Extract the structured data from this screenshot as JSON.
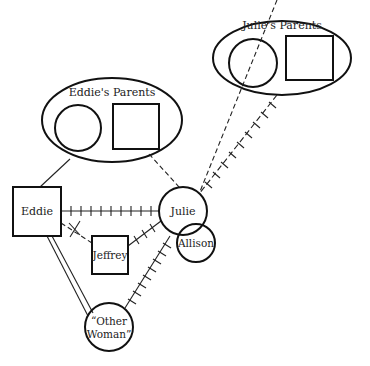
{
  "diagram": {
    "type": "genogram",
    "nodes": [
      {
        "id": "eddies-parents",
        "label": "Eddie's Parents",
        "shape": "ellipse-group",
        "members": [
          "female",
          "male"
        ]
      },
      {
        "id": "julies-parents",
        "label": "Julie's Parents",
        "shape": "ellipse-group",
        "members": [
          "female",
          "male"
        ]
      },
      {
        "id": "eddie",
        "label": "Eddie",
        "shape": "square"
      },
      {
        "id": "julie",
        "label": "Julie",
        "shape": "circle"
      },
      {
        "id": "allison",
        "label": "Allison",
        "shape": "circle"
      },
      {
        "id": "jeffrey",
        "label": "Jeffrey",
        "shape": "square"
      },
      {
        "id": "other-woman",
        "label_line1": "“Other",
        "label_line2": "Woman”",
        "shape": "circle"
      }
    ],
    "edges": [
      {
        "from": "eddies-parents",
        "to": "eddie",
        "style": "solid"
      },
      {
        "from": "eddies-parents",
        "to": "julie",
        "style": "dashed"
      },
      {
        "from": "julies-parents",
        "to": "julie",
        "style": "conflict-hatched"
      },
      {
        "from": "eddie",
        "to": "julie",
        "style": "conflict-hatched"
      },
      {
        "from": "eddie",
        "to": "jeffrey",
        "style": "dashed-cut"
      },
      {
        "from": "julie",
        "to": "jeffrey",
        "style": "conflict-hatched"
      },
      {
        "from": "julie",
        "to": "other-woman",
        "style": "conflict-hatched"
      },
      {
        "from": "eddie",
        "to": "other-woman",
        "style": "double-line"
      }
    ]
  },
  "labels": {
    "eddies_parents": "Eddie's Parents",
    "julies_parents": "Julie's Parents",
    "eddie": "Eddie",
    "julie": "Julie",
    "allison": "Allison",
    "jeffrey": "Jeffrey",
    "other_woman_1": "“Other",
    "other_woman_2": "Woman”"
  }
}
